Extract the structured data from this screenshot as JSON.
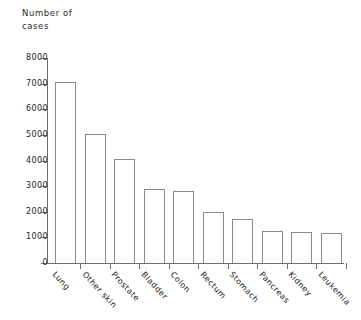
{
  "chart_data": {
    "type": "bar",
    "title": "",
    "ylabel": "Number of cases",
    "ylabel_lines": [
      "Number of",
      "cases"
    ],
    "xlabel": "",
    "categories": [
      "Lung",
      "Other skin",
      "Prostate",
      "Bladder",
      "Colon",
      "Rectum",
      "Stomach",
      "Pancreas",
      "Kidney",
      "Leukemia"
    ],
    "values": [
      7050,
      5050,
      4050,
      2900,
      2820,
      1980,
      1700,
      1260,
      1220,
      1180
    ],
    "ylim": [
      0,
      8000
    ],
    "yticks": [
      0,
      1000,
      2000,
      3000,
      4000,
      5000,
      6000,
      7000,
      8000
    ],
    "ytick_labels": [
      "0",
      "1000",
      "2000",
      "3000",
      "4000",
      "5000",
      "6000",
      "7000",
      "8000"
    ],
    "grid": false,
    "legend": null,
    "bar_fill": "#ffffff",
    "bar_stroke": "#8a8a8a",
    "axis_color": "#6e6e6e",
    "background": "#ffffff"
  }
}
